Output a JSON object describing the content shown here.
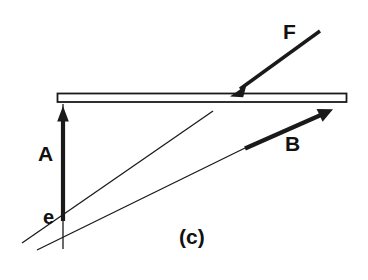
{
  "figure": {
    "panel_label": "(c)",
    "background_color": "#ffffff",
    "ink_color": "#1a1a1a",
    "plate_fill": "#ffffff",
    "labels": {
      "vector_a": "A",
      "vector_b": "B",
      "force_f": "F",
      "vertex_e": "e"
    },
    "geometry": {
      "plate": {
        "x": 57,
        "y": 93,
        "width": 290,
        "height": 9
      },
      "vertex": {
        "x": 63,
        "y": 222
      },
      "arrow_a": {
        "x1": 63,
        "y1": 220,
        "x2": 63,
        "y2": 108,
        "weight": 4
      },
      "arrow_b": {
        "x1": 245,
        "y1": 148,
        "x2": 331,
        "y2": 110,
        "weight": 4
      },
      "arrow_f": {
        "x1": 320,
        "y1": 32,
        "x2": 231,
        "y2": 96,
        "weight": 3
      },
      "ray_steep": {
        "x1": 22,
        "y1": 243,
        "x2": 213,
        "y2": 111,
        "weight": 1
      },
      "ray_shallow": {
        "x1": 37,
        "y1": 249,
        "x2": 244,
        "y2": 148,
        "weight": 1
      },
      "vertical_axis": {
        "x": 63,
        "y1": 104,
        "y2": 249,
        "weight": 1
      }
    }
  }
}
